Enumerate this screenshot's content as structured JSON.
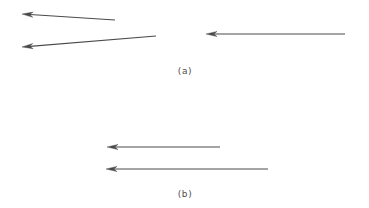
{
  "figure": {
    "width": 369,
    "height": 208,
    "background_color": "#ffffff",
    "stroke_color": "#4a4a4a",
    "caption_color": "#4d4d4d"
  },
  "panels": [
    {
      "id": "panel-a",
      "caption": "(a)",
      "caption_x": 185,
      "caption_y": 66,
      "arrows": [
        {
          "name": "arrow-a-upper-left",
          "direction": "left",
          "tail_x": 115,
          "tail_y": 20,
          "tip_x": 22,
          "tip_y": 14,
          "length": 93
        },
        {
          "name": "arrow-a-lower-left",
          "direction": "left",
          "tail_x": 156,
          "tail_y": 36,
          "tip_x": 22,
          "tip_y": 47,
          "length": 134
        },
        {
          "name": "arrow-a-right",
          "direction": "left",
          "tail_x": 345,
          "tail_y": 34,
          "tip_x": 206,
          "tip_y": 34,
          "length": 139
        }
      ]
    },
    {
      "id": "panel-b",
      "caption": "(b)",
      "caption_x": 185,
      "caption_y": 189,
      "arrows": [
        {
          "name": "arrow-b-upper",
          "direction": "left",
          "tail_x": 220,
          "tail_y": 147,
          "tip_x": 107,
          "tip_y": 147,
          "length": 113
        },
        {
          "name": "arrow-b-lower",
          "direction": "left",
          "tail_x": 268,
          "tail_y": 169,
          "tip_x": 106,
          "tip_y": 169,
          "length": 162
        }
      ]
    }
  ]
}
